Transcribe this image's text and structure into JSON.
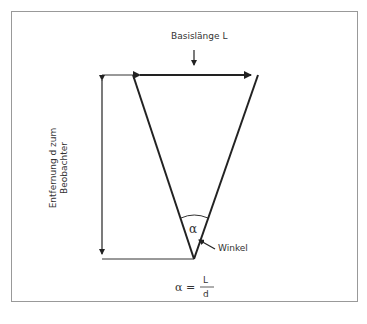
{
  "diagram": {
    "base_label": "Basislänge L",
    "distance_label_line1": "Entfernung d zum",
    "distance_label_line2": "Beobachter",
    "angle_symbol": "α",
    "angle_label": "Winkel",
    "formula": {
      "lhs": "α =",
      "numerator": "L",
      "denominator": "d"
    }
  }
}
